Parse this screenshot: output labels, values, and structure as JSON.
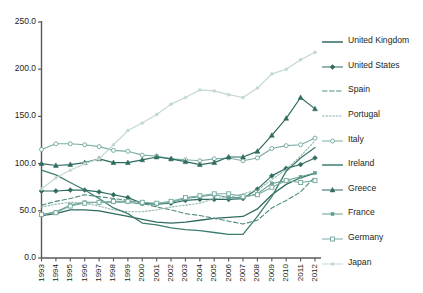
{
  "chart_data": {
    "type": "line",
    "title": "",
    "xlabel": "",
    "ylabel": "",
    "ylim": [
      0,
      250
    ],
    "ytick_step": 50,
    "grid": false,
    "legend_position": "right",
    "yticks": [
      "0.0",
      "50.0",
      "100.0",
      "150.0",
      "200.0",
      "250.0"
    ],
    "categories": [
      "1993",
      "1994",
      "1995",
      "1996",
      "1997",
      "1998",
      "1999",
      "2000",
      "2001",
      "2002",
      "2003",
      "2004",
      "2005",
      "2006",
      "2007",
      "2008",
      "2009",
      "2010",
      "2011",
      "2012"
    ],
    "series": [
      {
        "name": "United Kingdom",
        "color": "#2f6b60",
        "style": "solid",
        "marker": "none",
        "width": 1.3,
        "values": [
          45,
          47,
          51,
          51,
          50,
          47,
          44,
          41,
          38,
          37,
          38,
          40,
          42,
          43,
          44,
          52,
          67,
          78,
          85,
          90
        ]
      },
      {
        "name": "United States",
        "color": "#2f6b60",
        "style": "solid",
        "marker": "filled-diamond",
        "width": 1.2,
        "values": [
          71,
          71,
          72,
          72,
          70,
          67,
          64,
          58,
          57,
          58,
          61,
          62,
          62,
          62,
          63,
          73,
          87,
          95,
          99,
          106
        ]
      },
      {
        "name": "Spain",
        "color": "#4e8a7e",
        "style": "dashed",
        "marker": "none",
        "width": 1.1,
        "values": [
          56,
          60,
          63,
          67,
          65,
          63,
          61,
          58,
          54,
          51,
          47,
          45,
          42,
          39,
          36,
          40,
          53,
          61,
          70,
          86
        ]
      },
      {
        "name": "Portugal",
        "color": "#8fb6ad",
        "style": "dotted",
        "marker": "none",
        "width": 1.1,
        "values": [
          54,
          57,
          59,
          58,
          55,
          51,
          49,
          49,
          51,
          54,
          56,
          58,
          63,
          64,
          68,
          72,
          83,
          94,
          108,
          124
        ]
      },
      {
        "name": "Italy",
        "color": "#7bada4",
        "style": "solid",
        "marker": "open-circle",
        "width": 1.1,
        "values": [
          115,
          121,
          121,
          120,
          118,
          114,
          113,
          109,
          108,
          105,
          104,
          103,
          105,
          106,
          103,
          106,
          116,
          119,
          120,
          127
        ]
      },
      {
        "name": "Ireland",
        "color": "#3f7d71",
        "style": "solid",
        "marker": "none",
        "width": 1.3,
        "values": [
          93,
          88,
          80,
          72,
          63,
          53,
          47,
          37,
          35,
          32,
          30,
          29,
          27,
          25,
          25,
          44,
          65,
          92,
          106,
          117
        ]
      },
      {
        "name": "Greece",
        "color": "#2f6b60",
        "style": "solid",
        "marker": "filled-triangle",
        "width": 1.2,
        "values": [
          100,
          98,
          99,
          101,
          105,
          101,
          101,
          104,
          107,
          105,
          102,
          99,
          101,
          107,
          107,
          113,
          130,
          148,
          170,
          158
        ]
      },
      {
        "name": "France",
        "color": "#63a093",
        "style": "solid",
        "marker": "small-square",
        "width": 1.1,
        "values": [
          46,
          49,
          56,
          59,
          59,
          59,
          59,
          57,
          57,
          59,
          63,
          65,
          67,
          64,
          64,
          68,
          79,
          82,
          86,
          90
        ]
      },
      {
        "name": "Germany",
        "color": "#7bada4",
        "style": "solid",
        "marker": "open-square",
        "width": 1.1,
        "values": [
          46,
          48,
          55,
          58,
          59,
          60,
          60,
          59,
          58,
          60,
          64,
          66,
          68,
          68,
          65,
          67,
          75,
          82,
          80,
          82
        ]
      },
      {
        "name": "Japan",
        "color": "#c3d8d3",
        "style": "solid",
        "marker": "small-dot",
        "width": 1.2,
        "values": [
          73,
          85,
          93,
          100,
          105,
          120,
          135,
          143,
          152,
          163,
          170,
          178,
          177,
          173,
          170,
          180,
          195,
          200,
          210,
          218
        ]
      }
    ]
  },
  "legend": {
    "items": [
      {
        "label": "United Kingdom"
      },
      {
        "label": "United States"
      },
      {
        "label": "Spain"
      },
      {
        "label": "Portugal"
      },
      {
        "label": "Italy"
      },
      {
        "label": "Ireland"
      },
      {
        "label": "Greece"
      },
      {
        "label": "France"
      },
      {
        "label": "Germany"
      },
      {
        "label": "Japan"
      }
    ]
  }
}
